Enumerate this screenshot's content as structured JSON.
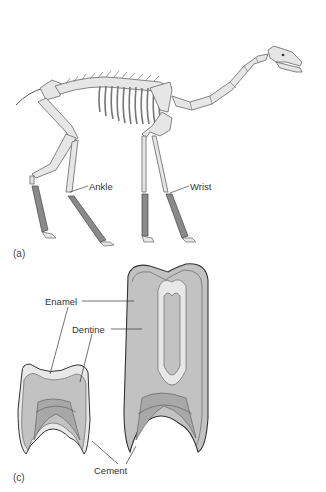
{
  "figure": {
    "panels": [
      {
        "id": "a",
        "label": "(a)",
        "subject": "skeleton",
        "annotations": [
          {
            "text": "Ankle"
          },
          {
            "text": "Wrist"
          }
        ]
      },
      {
        "id": "c",
        "label": "(c)",
        "subject": "teeth",
        "annotations": [
          {
            "text": "Enamel"
          },
          {
            "text": "Dentine"
          },
          {
            "text": "Cement"
          }
        ]
      }
    ]
  },
  "colors": {
    "bone_fill": "#e6e6e6",
    "bone_stroke": "#666666",
    "lower_leg_fill": "#8a8a8a",
    "dentine_fill": "#c2c2c2",
    "enamel_fill": "#e8e8e8",
    "pulp_fill": "#a8a8a8",
    "tooth_stroke": "#333333"
  }
}
